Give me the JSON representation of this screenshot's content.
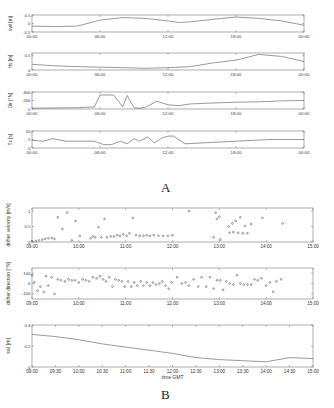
{
  "figure": {
    "panel_labels": [
      "A",
      "B"
    ]
  },
  "chart_data": [
    {
      "panel": "A",
      "type": "line",
      "ylabel": "swl [m]",
      "xlabel": "",
      "x_ticks": [
        "00:00",
        "06:00",
        "12:00",
        "18:00",
        "00:00"
      ],
      "y_ticks": [
        0.5,
        0,
        -0.5
      ],
      "ylim": [
        -0.5,
        0.5
      ],
      "x_hours": [
        0,
        2,
        4,
        6,
        8,
        10,
        12,
        13,
        14,
        16,
        18,
        20,
        22,
        24
      ],
      "values": [
        -0.15,
        -0.18,
        -0.15,
        0.2,
        0.35,
        0.3,
        0.15,
        0.05,
        0.1,
        0.25,
        0.38,
        0.3,
        0.15,
        -0.1
      ]
    },
    {
      "panel": "A",
      "type": "line",
      "ylabel": "Hs [m]",
      "xlabel": "",
      "x_ticks": [
        "00:00",
        "06:00",
        "12:00",
        "18:00",
        "00:00"
      ],
      "y_ticks": [
        0.5,
        0
      ],
      "ylim": [
        0,
        0.6
      ],
      "x_hours": [
        0,
        2,
        4,
        6,
        8,
        10,
        12,
        14,
        16,
        18,
        19,
        20,
        22,
        24
      ],
      "values": [
        0.2,
        0.15,
        0.12,
        0.1,
        0.08,
        0.06,
        0.08,
        0.12,
        0.25,
        0.35,
        0.45,
        0.55,
        0.48,
        0.3
      ]
    },
    {
      "panel": "A",
      "type": "line",
      "ylabel": "Dir [°N]",
      "xlabel": "",
      "x_ticks": [
        "00:00",
        "06:00",
        "12:00",
        "18:00",
        "00:00"
      ],
      "y_ticks": [
        400,
        200,
        0
      ],
      "ylim": [
        0,
        400
      ],
      "x_hours": [
        0,
        4,
        5.5,
        6,
        7.2,
        8,
        8.4,
        9,
        9.5,
        10,
        11,
        12,
        13,
        14,
        16,
        18,
        20,
        22,
        24
      ],
      "values": [
        20,
        30,
        50,
        330,
        330,
        50,
        320,
        30,
        20,
        40,
        180,
        100,
        80,
        120,
        140,
        160,
        170,
        190,
        200
      ]
    },
    {
      "panel": "A",
      "type": "line",
      "ylabel": "Tz [s]",
      "xlabel": "",
      "x_ticks": [
        "00:00",
        "06:00",
        "12:00",
        "18:00",
        "00:00"
      ],
      "y_ticks": [
        10,
        5,
        0
      ],
      "ylim": [
        0,
        10
      ],
      "x_hours": [
        0,
        1,
        1.8,
        3,
        5.5,
        6.3,
        7,
        7.8,
        8.4,
        9,
        9.5,
        10.2,
        10.8,
        11.5,
        12,
        12.5,
        13.5,
        15,
        18,
        21,
        24
      ],
      "values": [
        4.5,
        4,
        5.5,
        4,
        4,
        2,
        2,
        4,
        2.5,
        5.5,
        4,
        6.5,
        3,
        6,
        7,
        7,
        2.5,
        3,
        4,
        5,
        5
      ]
    },
    {
      "panel": "B",
      "type": "scatter",
      "ylabel": "drifter velocity [m/s]",
      "xlabel": "",
      "x_ticks": [
        "09:00",
        "10:00",
        "11:00",
        "12:00",
        "13:00",
        "14:00",
        "15:00"
      ],
      "y_ticks": [
        1,
        0.5,
        0
      ],
      "ylim": [
        0,
        1.1
      ],
      "x_hours": [
        9.0,
        9.08,
        9.15,
        9.22,
        9.28,
        9.35,
        9.42,
        9.48,
        9.55,
        9.65,
        9.75,
        9.85,
        9.93,
        10.02,
        10.25,
        10.3,
        10.35,
        10.42,
        10.48,
        10.55,
        10.6,
        10.68,
        10.75,
        10.82,
        10.88,
        10.95,
        11.02,
        11.08,
        11.15,
        11.22,
        11.3,
        11.38,
        11.45,
        11.52,
        11.6,
        11.7,
        11.8,
        11.9,
        12.0,
        12.35,
        12.88,
        12.92,
        12.95,
        13.0,
        13.02,
        13.2,
        13.22,
        13.28,
        13.3,
        13.35,
        13.4,
        13.45,
        13.5,
        13.55,
        13.6,
        13.68,
        13.92,
        14.35
      ],
      "values": [
        0.02,
        0.03,
        0.05,
        0.08,
        0.1,
        0.12,
        0.13,
        0.1,
        0.8,
        0.42,
        0.95,
        0.05,
        0.68,
        0.2,
        0.12,
        0.18,
        0.15,
        0.48,
        0.15,
        0.75,
        0.15,
        0.18,
        0.18,
        0.22,
        0.2,
        0.25,
        0.2,
        0.28,
        0.78,
        0.22,
        0.2,
        0.2,
        0.22,
        0.2,
        0.22,
        0.2,
        0.2,
        0.2,
        0.22,
        1.0,
        0.15,
        0.95,
        0.75,
        0.82,
        0.08,
        0.5,
        0.3,
        0.6,
        0.32,
        0.68,
        0.3,
        0.8,
        0.28,
        0.52,
        0.28,
        0.58,
        0.78,
        0.6
      ]
    },
    {
      "panel": "B",
      "type": "scatter",
      "ylabel": "drifter direction [°N]",
      "xlabel": "",
      "x_ticks": [
        "09:00",
        "10:00",
        "11:00",
        "12:00",
        "13:00",
        "14:00",
        "15:00"
      ],
      "y_ticks": [
        100,
        0,
        -100
      ],
      "ylim": [
        -150,
        150
      ],
      "x_hours": [
        9.0,
        9.05,
        9.12,
        9.18,
        9.25,
        9.3,
        9.35,
        9.42,
        9.48,
        9.55,
        9.62,
        9.7,
        9.78,
        9.85,
        9.92,
        10.0,
        10.08,
        10.15,
        10.22,
        10.3,
        10.38,
        10.45,
        10.52,
        10.58,
        10.65,
        10.72,
        10.78,
        10.85,
        10.92,
        10.98,
        11.05,
        11.12,
        11.18,
        11.25,
        11.32,
        11.38,
        11.45,
        11.52,
        11.58,
        11.65,
        11.72,
        11.78,
        11.85,
        11.92,
        11.98,
        12.1,
        12.2,
        12.28,
        12.35,
        12.45,
        12.55,
        12.62,
        12.72,
        12.8,
        12.88,
        12.95,
        13.02,
        13.08,
        13.15,
        13.22,
        13.3,
        13.38,
        13.45,
        13.52,
        13.6,
        13.68,
        13.75,
        13.82,
        13.9,
        14.0,
        14.08,
        14.15,
        14.22,
        14.32
      ],
      "values": [
        80,
        10,
        -70,
        -30,
        -80,
        70,
        -20,
        60,
        -100,
        40,
        30,
        20,
        40,
        30,
        30,
        10,
        40,
        30,
        20,
        60,
        50,
        70,
        40,
        20,
        60,
        -30,
        40,
        30,
        20,
        -30,
        20,
        -30,
        10,
        -20,
        20,
        -20,
        10,
        -20,
        10,
        -10,
        0,
        20,
        -20,
        -50,
        10,
        60,
        0,
        10,
        -20,
        40,
        -30,
        60,
        -30,
        60,
        -50,
        30,
        30,
        -60,
        20,
        0,
        -10,
        80,
        0,
        -10,
        -10,
        -10,
        40,
        30,
        50,
        -20,
        10,
        -80,
        20,
        40
      ]
    },
    {
      "panel": "B",
      "type": "line",
      "ylabel": "swl [m]",
      "xlabel": "time GMT",
      "x_ticks": [
        "09:00",
        "09:30",
        "10:00",
        "10:30",
        "11:00",
        "11:30",
        "12:00",
        "12:30",
        "13:00",
        "13:30",
        "14:00",
        "14:30",
        "15:00"
      ],
      "y_ticks": [
        0.4,
        0.2,
        0
      ],
      "ylim": [
        0,
        0.4
      ],
      "x_hours": [
        9.0,
        9.5,
        10.0,
        10.5,
        11.0,
        11.5,
        12.0,
        12.5,
        13.0,
        13.5,
        14.0,
        14.5,
        15.0
      ],
      "values": [
        0.31,
        0.29,
        0.26,
        0.22,
        0.19,
        0.16,
        0.13,
        0.09,
        0.07,
        0.06,
        0.05,
        0.09,
        0.08
      ]
    }
  ]
}
